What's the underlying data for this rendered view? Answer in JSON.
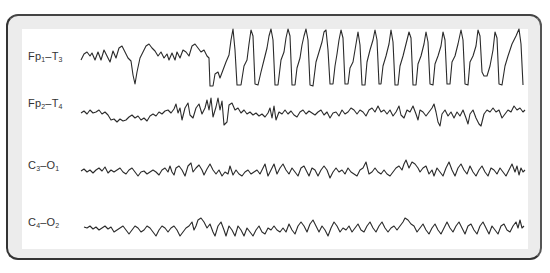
{
  "figure": {
    "title": "",
    "type": "EEG recording",
    "channels": [
      {
        "id": "fp1-t3",
        "main1": "Fp",
        "sub1": "1",
        "sep": "–",
        "main2": "T",
        "sub2": "3",
        "text": "Fp1–T3",
        "pattern": "normal background then generalized spike-and-wave discharge"
      },
      {
        "id": "fp2-t4",
        "main1": "Fp",
        "sub1": "2",
        "sep": "–",
        "main2": "T",
        "sub2": "4",
        "text": "Fp2–T4",
        "pattern": "low amplitude irregular activity"
      },
      {
        "id": "c3-o1",
        "main1": "C",
        "sub1": "3",
        "sep": "–",
        "main2": "O",
        "sub2": "1",
        "text": "C3–O1",
        "pattern": "low amplitude irregular activity"
      },
      {
        "id": "c4-o2",
        "main1": "C",
        "sub1": "4",
        "sep": "–",
        "main2": "O",
        "sub2": "2",
        "text": "C4–O2",
        "pattern": "low amplitude irregular activity"
      }
    ]
  },
  "colors": {
    "trace": "#2a2a2a",
    "frame_bg": "#ececec",
    "frame_border": "#333333",
    "panel_bg": "#ffffff"
  }
}
